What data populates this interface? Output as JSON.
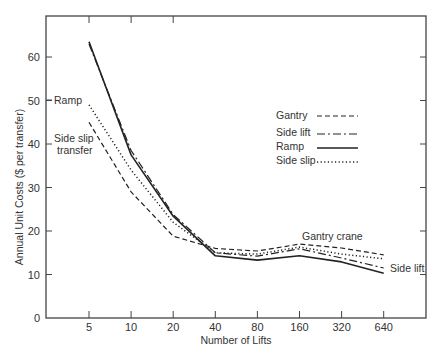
{
  "chart_data": {
    "type": "line",
    "title": "",
    "xlabel": "Number of Lifts",
    "ylabel": "Annual Unit Costs ($ per transfer)",
    "x": [
      5,
      10,
      20,
      40,
      80,
      160,
      320,
      640
    ],
    "x_tick_labels": [
      "5",
      "10",
      "20",
      "40",
      "80",
      "160",
      "320",
      "640"
    ],
    "x_scale": "log2",
    "y_ticks": [
      0,
      10,
      20,
      30,
      40,
      50,
      60
    ],
    "ylim": [
      0,
      70
    ],
    "grid": false,
    "legend_position": "upper right (inside)",
    "series": [
      {
        "name": "Gantry",
        "style": "dashed",
        "values": [
          45,
          29,
          18.8,
          16,
          15.4,
          17,
          16.1,
          14.5
        ]
      },
      {
        "name": "Side lift",
        "style": "dash-dot",
        "values": [
          63,
          38.5,
          23.8,
          15,
          14.2,
          15.9,
          13.8,
          11.5
        ]
      },
      {
        "name": "Ramp",
        "style": "solid",
        "values": [
          63.5,
          37.5,
          23.4,
          14.3,
          13.3,
          14.3,
          12.9,
          10.3
        ]
      },
      {
        "name": "Side slip",
        "style": "dotted",
        "values": [
          49,
          34,
          22,
          15,
          14.7,
          16.3,
          14.7,
          13.6
        ]
      }
    ],
    "annotations": [
      {
        "text": "Ramp",
        "near": "x=5, y=50"
      },
      {
        "text": "Side slip transfer",
        "near": "x=5, y=40"
      },
      {
        "text": "Gantry crane",
        "near": "x=160, y=18"
      },
      {
        "text": "Side lift",
        "near": "x=640, y=11"
      }
    ]
  },
  "labels": {
    "xlabel": "Number of Lifts",
    "ylabel": "Annual Unit Costs ($ per transfer)",
    "annot_ramp": "Ramp",
    "annot_sideslip_1": "Side slip",
    "annot_sideslip_2": "transfer",
    "annot_gantry": "Gantry crane",
    "annot_sidelift": "Side lift"
  },
  "legend": [
    {
      "label": "Gantry"
    },
    {
      "label": "Side lift"
    },
    {
      "label": "Ramp"
    },
    {
      "label": "Side slip"
    }
  ]
}
